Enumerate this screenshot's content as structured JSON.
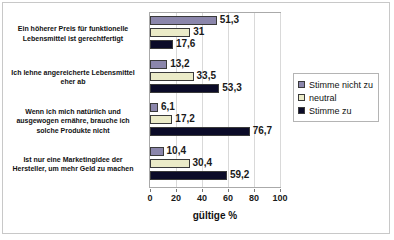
{
  "chart_data": {
    "type": "bar",
    "orientation": "horizontal",
    "title": "",
    "xlabel": "gültige %",
    "ylabel": "",
    "xlim": [
      0,
      100
    ],
    "xticks": [
      "0",
      "20",
      "40",
      "60",
      "80",
      "100"
    ],
    "grid": true,
    "legend_position": "right",
    "categories": [
      "Ein höherer Preis für funktionelle Lebensmittel ist gerechtfertigt",
      "Ich lehne angereicherte Lebensmittel eher ab",
      "Wenn ich mich natürlich und ausgewogen ernähre, brauche ich solche Produkte nicht",
      "Ist nur eine Marketingidee der Hersteller, um mehr Geld zu machen"
    ],
    "category_lines": [
      [
        "Ein höherer Preis für funktionelle",
        "Lebensmittel ist gerechtfertigt"
      ],
      [
        "Ich lehne angereicherte Lebensmittel",
        "eher ab"
      ],
      [
        "Wenn ich mich natürlich und",
        "ausgewogen ernähre, brauche ich",
        "solche Produkte nicht"
      ],
      [
        "Ist nur eine Marketingidee der",
        "Hersteller, um mehr Geld zu machen"
      ]
    ],
    "series": [
      {
        "name": "Stimme nicht zu",
        "color": "#8b86ab",
        "values": [
          51.3,
          13.2,
          6.1,
          10.4
        ],
        "labels": [
          "51,3",
          "13,2",
          "6,1",
          "10,4"
        ]
      },
      {
        "name": "neutral",
        "color": "#ebebc8",
        "values": [
          31,
          33.5,
          17.2,
          30.4
        ],
        "labels": [
          "31",
          "33,5",
          "17,2",
          "30,4"
        ]
      },
      {
        "name": "Stimme zu",
        "color": "#0b0b28",
        "values": [
          17.6,
          53.3,
          76.7,
          59.2
        ],
        "labels": [
          "17,6",
          "53,3",
          "76,7",
          "59,2"
        ]
      }
    ]
  },
  "legend": {
    "items": [
      {
        "label": "Stimme nicht zu",
        "swatch": "#8b86ab"
      },
      {
        "label": "neutral",
        "swatch": "#ebebc8"
      },
      {
        "label": "Stimme zu",
        "swatch": "#0b0b28"
      }
    ]
  }
}
